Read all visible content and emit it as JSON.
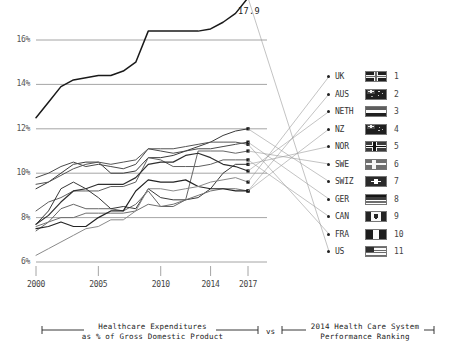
{
  "caption": {
    "left_line1": "Healthcare Expenditures",
    "left_line2": "as % of Gross Domestic Product",
    "vs": "vs",
    "right_line1": "2014 Health Care System",
    "right_line2": "Performance Ranking"
  },
  "peak_annotation": "17.9",
  "legend": {
    "items": [
      {
        "name": "UK",
        "rank": "1",
        "flag": "uk-flag"
      },
      {
        "name": "AUS",
        "rank": "2",
        "flag": "australia-flag"
      },
      {
        "name": "NETH",
        "rank": "3",
        "flag": "netherlands-flag"
      },
      {
        "name": "NZ",
        "rank": "4",
        "flag": "new-zealand-flag"
      },
      {
        "name": "NOR",
        "rank": "5",
        "flag": "norway-flag"
      },
      {
        "name": "SWE",
        "rank": "6",
        "flag": "sweden-flag"
      },
      {
        "name": "SWIZ",
        "rank": "7",
        "flag": "switzerland-flag"
      },
      {
        "name": "GER",
        "rank": "8",
        "flag": "germany-flag"
      },
      {
        "name": "CAN",
        "rank": "9",
        "flag": "canada-flag"
      },
      {
        "name": "FRA",
        "rank": "10",
        "flag": "france-flag"
      },
      {
        "name": "US",
        "rank": "11",
        "flag": "us-flag"
      }
    ]
  },
  "chart_data": {
    "type": "line",
    "title": "",
    "xlabel": "",
    "ylabel": "",
    "xlim": [
      2000,
      2017
    ],
    "ylim": [
      6,
      18
    ],
    "grid": true,
    "legend_position": "right",
    "xticks": [
      "2000",
      "2005",
      "2010",
      "2014",
      "2017"
    ],
    "xtick_values": [
      2000,
      2005,
      2010,
      2014,
      2017
    ],
    "yticks": [
      "6%",
      "8%",
      "10%",
      "12%",
      "14%",
      "16%"
    ],
    "ytick_values": [
      6,
      8,
      10,
      12,
      14,
      16
    ],
    "x": [
      2000,
      2001,
      2002,
      2003,
      2004,
      2005,
      2006,
      2007,
      2008,
      2009,
      2010,
      2011,
      2012,
      2013,
      2014,
      2015,
      2016,
      2017
    ],
    "series": [
      {
        "name": "US",
        "rank": 11,
        "color": "#1a1a1a",
        "width": 1.5,
        "values": [
          12.5,
          13.2,
          13.9,
          14.2,
          14.3,
          14.4,
          14.4,
          14.6,
          15.0,
          16.4,
          16.4,
          16.4,
          16.4,
          16.4,
          16.5,
          16.8,
          17.2,
          17.9
        ],
        "end_value": 17.9,
        "labeled": true
      },
      {
        "name": "SWIZ",
        "rank": 7,
        "color": "#3a3a3a",
        "width": 1.0,
        "values": [
          9.3,
          9.6,
          10.0,
          10.4,
          10.5,
          10.5,
          10.0,
          10.0,
          10.1,
          10.7,
          10.7,
          10.8,
          11.0,
          11.2,
          11.4,
          11.7,
          11.9,
          12.0
        ],
        "end_value": 12.0
      },
      {
        "name": "GER",
        "rank": 8,
        "color": "#4a4a4a",
        "width": 1.0,
        "values": [
          9.8,
          10.0,
          10.3,
          10.5,
          10.3,
          10.4,
          10.3,
          10.2,
          10.4,
          11.1,
          11.0,
          10.9,
          11.0,
          11.1,
          11.1,
          11.2,
          11.3,
          11.4
        ],
        "end_value": 11.4
      },
      {
        "name": "FRA",
        "rank": 10,
        "color": "#555555",
        "width": 1.0,
        "values": [
          9.5,
          9.6,
          9.9,
          10.2,
          10.4,
          10.5,
          10.4,
          10.5,
          10.6,
          11.1,
          11.1,
          11.1,
          11.2,
          11.3,
          11.4,
          11.4,
          11.4,
          11.3
        ],
        "end_value": 11.3
      },
      {
        "name": "SWE",
        "rank": 6,
        "color": "#666666",
        "width": 1.0,
        "values": [
          7.4,
          7.8,
          8.4,
          8.6,
          8.4,
          8.4,
          8.4,
          8.3,
          8.6,
          9.2,
          8.5,
          8.5,
          8.8,
          11.0,
          11.0,
          11.0,
          10.9,
          11.0
        ],
        "end_value": 11.0
      },
      {
        "name": "CAN",
        "rank": 9,
        "color": "#5f5f5f",
        "width": 1.0,
        "values": [
          8.3,
          8.7,
          8.9,
          9.2,
          9.2,
          9.2,
          9.4,
          9.4,
          9.6,
          10.7,
          10.6,
          10.3,
          10.3,
          10.3,
          10.4,
          10.6,
          10.6,
          10.6
        ],
        "end_value": 10.6
      },
      {
        "name": "NETH",
        "rank": 3,
        "color": "#2f2f2f",
        "width": 1.2,
        "values": [
          7.7,
          8.1,
          8.7,
          9.2,
          9.3,
          9.5,
          9.5,
          9.5,
          9.8,
          10.4,
          10.5,
          10.5,
          10.8,
          10.9,
          10.7,
          10.4,
          10.3,
          10.1
        ],
        "end_value": 10.1
      },
      {
        "name": "NOR",
        "rank": 5,
        "color": "#383838",
        "width": 1.0,
        "values": [
          7.7,
          8.3,
          9.3,
          9.6,
          9.3,
          8.9,
          8.4,
          8.5,
          8.4,
          9.3,
          8.9,
          8.8,
          8.8,
          8.9,
          9.3,
          10.0,
          10.4,
          10.4
        ],
        "end_value": 10.4
      },
      {
        "name": "AUS",
        "rank": 2,
        "color": "#707070",
        "width": 1.0,
        "values": [
          7.6,
          7.8,
          8.0,
          8.0,
          8.2,
          8.2,
          8.2,
          8.2,
          8.3,
          8.6,
          8.5,
          8.6,
          8.8,
          9.0,
          9.2,
          9.3,
          9.3,
          9.2
        ],
        "end_value": 9.2
      },
      {
        "name": "NZ",
        "rank": 4,
        "color": "#232323",
        "width": 1.2,
        "values": [
          7.5,
          7.6,
          7.8,
          7.6,
          7.6,
          8.0,
          8.3,
          8.3,
          9.2,
          9.7,
          9.6,
          9.6,
          9.7,
          9.4,
          9.3,
          9.3,
          9.2,
          9.2
        ],
        "end_value": 9.2
      },
      {
        "name": "UK",
        "rank": 1,
        "color": "#8a8a8a",
        "width": 1.0,
        "values": [
          6.3,
          6.6,
          6.9,
          7.2,
          7.5,
          7.6,
          7.9,
          7.9,
          8.3,
          9.3,
          9.3,
          9.2,
          9.3,
          9.4,
          9.6,
          9.7,
          9.8,
          9.6
        ],
        "end_value": 9.6
      }
    ]
  }
}
